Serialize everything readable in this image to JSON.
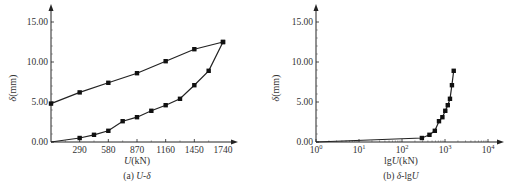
{
  "chart_data": [
    {
      "type": "line",
      "panel": "a",
      "title": "",
      "caption": "(a) U-δ",
      "caption_prefix": "(a) ",
      "caption_italic": "U-δ",
      "xlabel": "U(kN)",
      "ylabel": "δ(mm)",
      "xlim": [
        0,
        1740
      ],
      "ylim": [
        0,
        15
      ],
      "xticks": [
        290,
        580,
        870,
        1160,
        1450,
        1740
      ],
      "xtick_labels": [
        "290",
        "580",
        "870",
        "1160",
        "1450",
        "1740"
      ],
      "yticks": [
        0,
        5,
        10,
        15
      ],
      "ytick_labels": [
        "0.00",
        "5.00",
        "10.00",
        "15.00"
      ],
      "grid": false,
      "series": [
        {
          "name": "loading",
          "x": [
            0,
            290,
            435,
            580,
            725,
            870,
            1015,
            1160,
            1305,
            1450,
            1595,
            1740
          ],
          "y": [
            0.0,
            0.5,
            0.9,
            1.4,
            2.6,
            3.1,
            3.9,
            4.6,
            5.4,
            7.1,
            8.9,
            12.5
          ]
        },
        {
          "name": "unloading",
          "x": [
            1740,
            1450,
            1160,
            870,
            580,
            290,
            0
          ],
          "y": [
            12.5,
            11.6,
            10.1,
            8.6,
            7.4,
            6.2,
            4.8
          ]
        }
      ]
    },
    {
      "type": "line",
      "panel": "b",
      "title": "",
      "caption": "(b) δ-lgU",
      "caption_prefix": "(b)  ",
      "caption_italic": "δ-lgU",
      "xlabel": "lgU(kN)",
      "ylabel": "δ(mm)",
      "xscale": "log",
      "xlim": [
        1,
        10000
      ],
      "ylim": [
        0,
        15
      ],
      "xticks": [
        1,
        10,
        100,
        1000,
        10000
      ],
      "xtick_labels": [
        "10^0",
        "10^1",
        "10^2",
        "10^3",
        "10^4"
      ],
      "yticks": [
        0,
        5,
        10,
        15
      ],
      "ytick_labels": [
        "0.00",
        "5.00",
        "10.00",
        "15.00"
      ],
      "grid": false,
      "series": [
        {
          "name": "loading",
          "x": [
            1,
            290,
            435,
            580,
            725,
            870,
            1015,
            1160,
            1305,
            1450,
            1595
          ],
          "y": [
            0.0,
            0.5,
            0.9,
            1.4,
            2.6,
            3.1,
            3.9,
            4.6,
            5.4,
            7.1,
            8.9
          ]
        }
      ]
    }
  ]
}
